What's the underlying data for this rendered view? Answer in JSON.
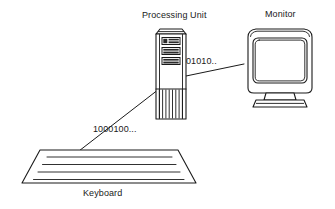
{
  "figure": {
    "background_color": "#ffffff",
    "line_color": "#1a1a1a"
  },
  "components": {
    "processing_unit": {
      "label": "Processing Unit",
      "icon": "tower-computer-icon",
      "drive_bays": 3
    },
    "monitor": {
      "label": "Monitor",
      "icon": "crt-monitor-icon",
      "screen_content": ""
    },
    "keyboard": {
      "label": "Keyboard",
      "icon": "keyboard-icon",
      "key_rows": 4
    }
  },
  "connections": [
    {
      "name": "keyboard-to-processing-unit",
      "data_label": "1000100...",
      "from": "keyboard",
      "to": "processing_unit"
    },
    {
      "name": "processing-unit-to-monitor",
      "data_label": "01010..",
      "from": "processing_unit",
      "to": "monitor"
    }
  ]
}
